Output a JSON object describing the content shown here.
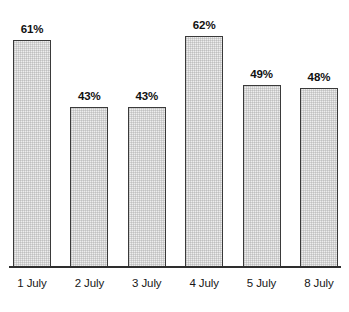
{
  "chart_data": {
    "type": "bar",
    "title": "",
    "subtitle": "",
    "xlabel": "",
    "ylabel": "",
    "ylim": [
      0,
      70
    ],
    "grid": false,
    "legend": false,
    "legend_position": "none",
    "orientation": "vertical",
    "value_labels_shown": true,
    "value_label_suffix": "%",
    "categories": [
      "1 July",
      "2 July",
      "3 July",
      "4 July",
      "5 July",
      "8 July"
    ],
    "values": [
      61,
      43,
      43,
      62,
      49,
      48
    ],
    "value_labels": [
      "61%",
      "43%",
      "43%",
      "62%",
      "49%",
      "48%"
    ],
    "series": [
      {
        "name": "",
        "values": [
          61,
          43,
          43,
          62,
          49,
          48
        ]
      }
    ]
  },
  "style": {
    "background": "#ffffff",
    "bar_fill": "#ededed",
    "bar_border": "#3a3a3a",
    "axis_color": "#2e2e2e",
    "text_color": "#161616"
  },
  "bars": [
    {
      "label": "1 July",
      "value_label": "61%",
      "value": 61
    },
    {
      "label": "2 July",
      "value_label": "43%",
      "value": 43
    },
    {
      "label": "3 July",
      "value_label": "43%",
      "value": 43
    },
    {
      "label": "4 July",
      "value_label": "62%",
      "value": 62
    },
    {
      "label": "5 July",
      "value_label": "49%",
      "value": 49
    },
    {
      "label": "8 July",
      "value_label": "48%",
      "value": 48
    }
  ]
}
